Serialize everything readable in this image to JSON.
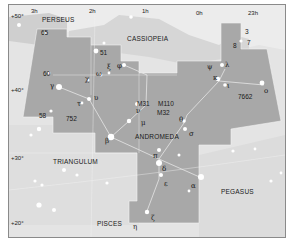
{
  "map": {
    "title": "Andromeda star chart",
    "colors": {
      "background": "#e4e4e4",
      "andromeda_fill": "#a8a8a8",
      "neighbor_fill": "#cfcfcf",
      "light_region": "#ececec",
      "boundary": "#f2f2f2",
      "stick_line": "#e0e0e0",
      "text": "#1a1a1a"
    },
    "ra_labels": [
      "3h",
      "2h",
      "1h",
      "0h",
      "23h"
    ],
    "dec_labels": [
      "+50°",
      "+40°",
      "+30°",
      "+20°"
    ],
    "constellations": {
      "perseus": "PERSEUS",
      "cassiopeia": "CASSIOPEIA",
      "andromeda": "ANDROMEDA",
      "triangulum": "TRIANGULUM",
      "pegasus": "PEGASUS",
      "pisces": "PISCES"
    },
    "stars": {
      "s65": "65",
      "s51": "51",
      "s60": "60",
      "s58": "58",
      "gamma": "γ",
      "chi": "χ",
      "omega": "ω",
      "xi": "ξ",
      "phi": "φ",
      "tau": "τ",
      "upsilon": "υ",
      "beta": "β",
      "mu": "μ",
      "nu": "ν",
      "theta": "θ",
      "sigma": "σ",
      "pi": "π",
      "delta": "δ",
      "epsilon": "ε",
      "alpha": "α",
      "zeta": "ζ",
      "eta": "η",
      "psi": "ψ",
      "lambda": "λ",
      "kappa": "κ",
      "iota": "ι",
      "omicron": "o",
      "s3": "3",
      "s7": "7",
      "s8": "8"
    },
    "deep_sky": {
      "m31": "M31",
      "m110": "M110",
      "m32": "M32",
      "ngc752": "752",
      "ngc7662": "7662"
    }
  }
}
